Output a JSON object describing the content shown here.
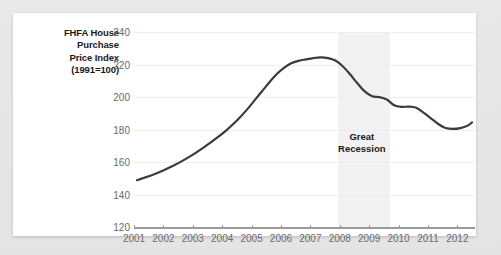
{
  "chart_data": {
    "type": "line",
    "title": "",
    "ylabel": "FHFA House Purchase Price Index (1991=100)",
    "ylabel_lines": [
      "FHFA House",
      "Purchase",
      "Price Index",
      "(1991=100)"
    ],
    "xlabel": "",
    "ylim": [
      120,
      240
    ],
    "xlim": [
      2001,
      2012.6
    ],
    "yticks": [
      120,
      140,
      160,
      180,
      200,
      220,
      240
    ],
    "ytick_labels": [
      "120",
      "140",
      "160",
      "180",
      "200",
      "220",
      "240"
    ],
    "xticks": [
      2001,
      2002,
      2003,
      2004,
      2005,
      2006,
      2007,
      2008,
      2009,
      2010,
      2011,
      2012
    ],
    "xtick_labels": [
      "2001",
      "2002",
      "2003",
      "2004",
      "2005",
      "2006",
      "2007",
      "2008",
      "2009",
      "2010",
      "2011",
      "2012"
    ],
    "grid": true,
    "legend": "none",
    "line_color": "#3b3b3b",
    "grid_color": "#eeeeee",
    "axis_color": "#9a9a9a",
    "annotations": [
      {
        "text": "Great Recession",
        "lines": [
          "Great",
          "Recession"
        ],
        "x": 2008.75,
        "y": 172,
        "type": "shaded-band-label"
      }
    ],
    "shaded_bands": [
      {
        "label": "Great Recession",
        "x_start": 2007.95,
        "x_end": 2009.7,
        "color": "#f2f2f2"
      }
    ],
    "series": [
      {
        "name": "FHFA House Purchase Price Index",
        "x": [
          2001.1,
          2001.35,
          2001.6,
          2001.85,
          2002.1,
          2002.35,
          2002.6,
          2002.85,
          2003.1,
          2003.35,
          2003.6,
          2003.85,
          2004.1,
          2004.35,
          2004.6,
          2004.85,
          2005.1,
          2005.35,
          2005.6,
          2005.85,
          2006.1,
          2006.35,
          2006.6,
          2006.85,
          2007.1,
          2007.35,
          2007.6,
          2007.85,
          2008.1,
          2008.35,
          2008.6,
          2008.85,
          2009.1,
          2009.35,
          2009.6,
          2009.85,
          2010.1,
          2010.35,
          2010.6,
          2010.85,
          2011.1,
          2011.35,
          2011.6,
          2011.85,
          2012.1,
          2012.35,
          2012.5
        ],
        "y": [
          149.0,
          150.5,
          152.0,
          153.8,
          155.8,
          158.0,
          160.4,
          163.0,
          165.8,
          168.8,
          172.0,
          175.4,
          179.0,
          183.0,
          187.5,
          192.5,
          198.0,
          203.5,
          209.0,
          214.0,
          218.0,
          220.8,
          222.3,
          223.2,
          224.0,
          224.4,
          224.0,
          222.5,
          219.0,
          214.0,
          208.5,
          203.5,
          200.5,
          200.0,
          198.5,
          195.0,
          194.0,
          194.2,
          193.5,
          190.5,
          187.0,
          183.5,
          181.0,
          180.5,
          181.0,
          182.5,
          184.5
        ]
      }
    ]
  }
}
